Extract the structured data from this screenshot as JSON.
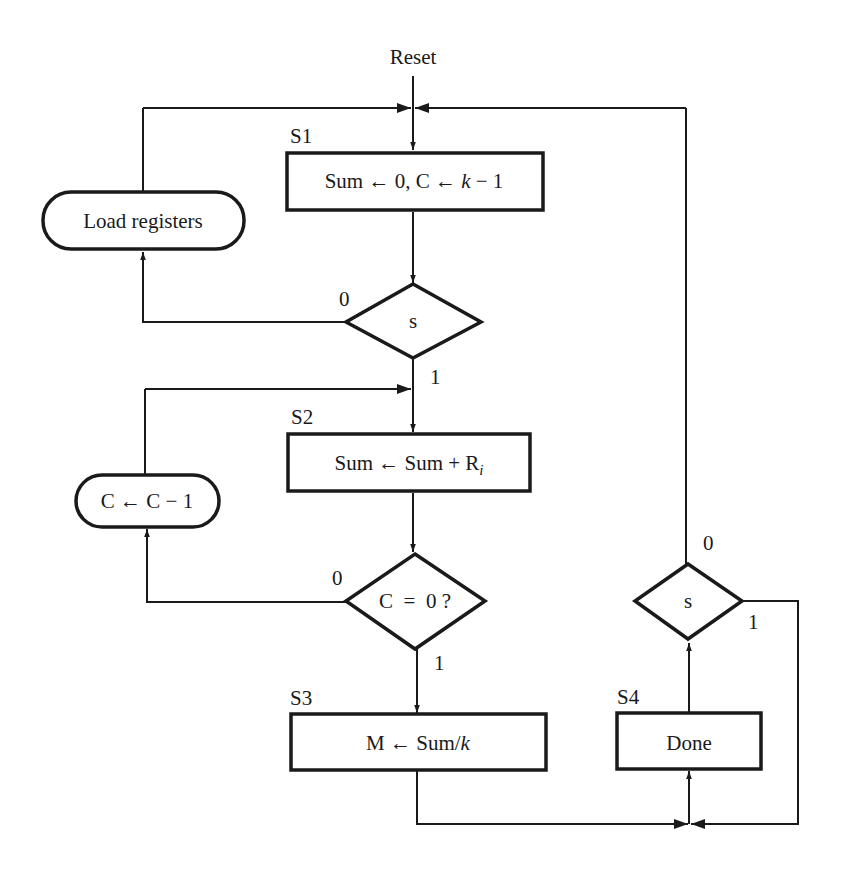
{
  "diagram": {
    "type": "ASM flowchart",
    "entry": {
      "label": "Reset"
    },
    "states": [
      {
        "id": "S1",
        "label": "S1",
        "action_parts": [
          "Sum ← 0, C ← ",
          "k",
          " − 1"
        ]
      },
      {
        "id": "S2",
        "label": "S2",
        "action_parts": [
          "Sum ← Sum + R",
          "i"
        ]
      },
      {
        "id": "S3",
        "label": "S3",
        "action_parts": [
          "M ← Sum/",
          "k"
        ]
      },
      {
        "id": "S4",
        "label": "S4",
        "action_parts": [
          "Done"
        ]
      }
    ],
    "conditional_outputs": [
      {
        "id": "load",
        "text": "Load registers"
      },
      {
        "id": "dec",
        "text": "C ← C − 1"
      }
    ],
    "decisions": [
      {
        "id": "d1",
        "text": "s",
        "branch0": "0",
        "branch1": "1"
      },
      {
        "id": "d2",
        "text": "C  =  0 ?",
        "branch0": "0",
        "branch1": "1"
      },
      {
        "id": "d3",
        "text": "s",
        "branch0": "0",
        "branch1": "1"
      }
    ],
    "edges": [
      {
        "from": "Reset",
        "to": "S1"
      },
      {
        "from": "S1",
        "to": "d1"
      },
      {
        "from": "d1",
        "branch": "0",
        "to": "load"
      },
      {
        "from": "load",
        "to": "S1"
      },
      {
        "from": "d1",
        "branch": "1",
        "to": "S2"
      },
      {
        "from": "S2",
        "to": "d2"
      },
      {
        "from": "d2",
        "branch": "0",
        "to": "dec"
      },
      {
        "from": "dec",
        "to": "S2"
      },
      {
        "from": "d2",
        "branch": "1",
        "to": "S3"
      },
      {
        "from": "S3",
        "to": "S4"
      },
      {
        "from": "S4",
        "to": "d3"
      },
      {
        "from": "d3",
        "branch": "0",
        "to": "S1"
      },
      {
        "from": "d3",
        "branch": "1",
        "to": "S4"
      }
    ]
  }
}
